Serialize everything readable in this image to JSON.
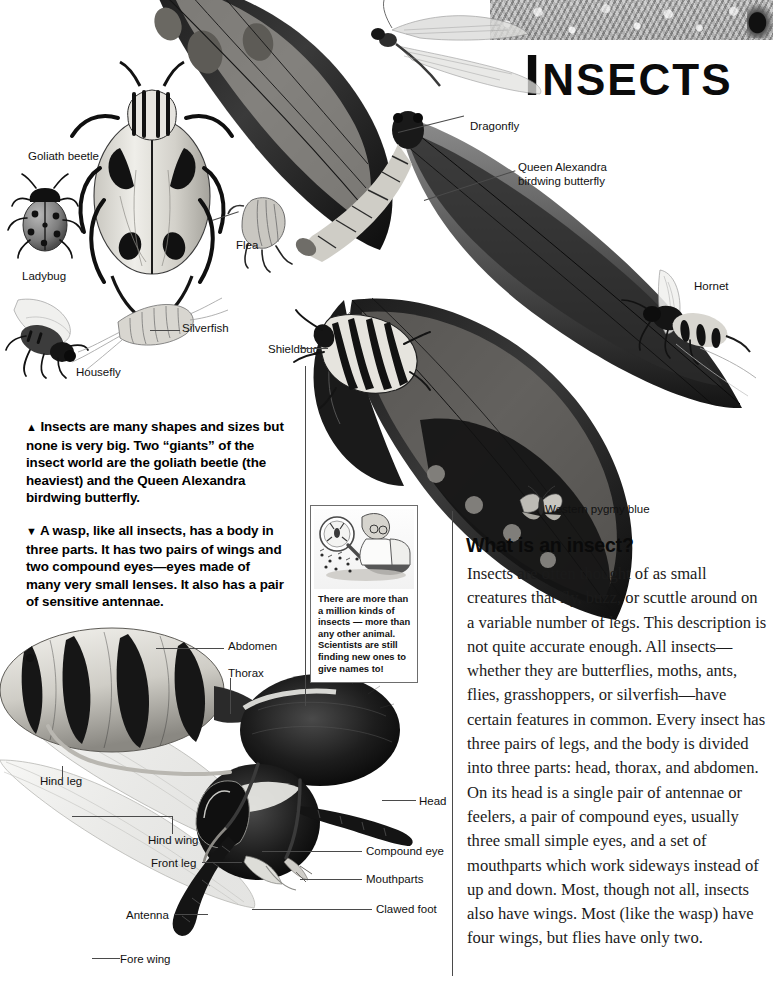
{
  "page": {
    "headline_cap": "I",
    "headline_rest": "NSECTS",
    "background": "#ffffff",
    "ink": "#111111"
  },
  "specimen_labels": [
    {
      "name": "goliath-beetle",
      "text": "Goliath beetle"
    },
    {
      "name": "ladybug",
      "text": "Ladybug"
    },
    {
      "name": "housefly",
      "text": "Housefly"
    },
    {
      "name": "silverfish",
      "text": "Silverfish"
    },
    {
      "name": "flea",
      "text": "Flea"
    },
    {
      "name": "shieldbug",
      "text": "Shieldbug"
    },
    {
      "name": "dragonfly",
      "text": "Dragonfly"
    },
    {
      "name": "queen-alexandra-line1",
      "text": "Queen Alexandra"
    },
    {
      "name": "queen-alexandra-line2",
      "text": "birdwing butterfly"
    },
    {
      "name": "hornet",
      "text": "Hornet"
    },
    {
      "name": "western-pygmy-blue",
      "text": "Western pygmy blue"
    }
  ],
  "captions": [
    {
      "name": "caption-sizes",
      "marker": "▲",
      "text": "Insects are many shapes and sizes but none is very big. Two “giants” of the insect world are the goliath beetle (the heaviest) and the Queen Alexandra birdwing butterfly."
    },
    {
      "name": "caption-wasp",
      "marker": "▼",
      "text": "A wasp, like all insects, has a body in three parts. It has two pairs of wings and two compound eyes—eyes made of many very small lenses. It also has a pair of sensitive antennae."
    }
  ],
  "inset": {
    "text": "There are more than a million kinds of insects — more than any other animal. Scientists are still finding new ones to give names to!",
    "illustration": "scientist-with-magnifying-glass"
  },
  "article": {
    "heading": "What is an insect?",
    "paragraph": "Insects are often thought of as small creatures that fly, buzz, or scuttle around on a variable number of legs. This description is not quite accurate enough. All insects—whether they are butterflies, moths, ants, flies, grasshoppers, or silverfish—have certain features in common. Every insect has three pairs of legs, and the body is divided into three parts: head, thorax, and abdomen. On its head is a single pair of antennae or feelers, a pair of compound eyes, usually three small simple eyes, and a set of mouthparts which work sideways instead of up and down. Most, though not all, insects also have wings. Most (like the wasp) have four wings, but flies have only two."
  },
  "wasp_diagram": {
    "labels": [
      {
        "name": "abdomen",
        "text": "Abdomen"
      },
      {
        "name": "thorax",
        "text": "Thorax"
      },
      {
        "name": "hind-leg",
        "text": "Hind leg"
      },
      {
        "name": "hind-wing",
        "text": "Hind wing"
      },
      {
        "name": "front-leg",
        "text": "Front leg"
      },
      {
        "name": "antenna",
        "text": "Antenna"
      },
      {
        "name": "fore-wing",
        "text": "Fore wing"
      },
      {
        "name": "head",
        "text": "Head"
      },
      {
        "name": "compound-eye",
        "text": "Compound eye"
      },
      {
        "name": "mouthparts",
        "text": "Mouthparts"
      },
      {
        "name": "clawed-foot",
        "text": "Clawed foot"
      }
    ]
  }
}
